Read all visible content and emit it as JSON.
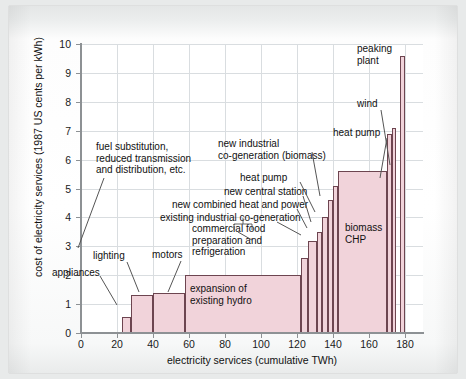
{
  "chart_data": {
    "type": "bar",
    "title": "",
    "xlabel": "electricity services (cumulative TWh)",
    "ylabel": "cost of electricity services (1987 US cents per kWh)",
    "xlim": [
      0,
      190
    ],
    "ylim": [
      0,
      10
    ],
    "xticks": [
      0,
      20,
      40,
      60,
      80,
      100,
      120,
      140,
      160,
      180
    ],
    "yticks": [
      0,
      1,
      2,
      3,
      4,
      5,
      6,
      7,
      8,
      9,
      10
    ],
    "grid": true,
    "legend": "none",
    "note": "supply curve: each bar spans a cumulative TWh range (x_start to x_end) at a cost in 1987 US cents per kWh",
    "bars": [
      {
        "label": "appliances",
        "x_start": 23,
        "x_end": 28,
        "value": 0.55
      },
      {
        "label": "lighting",
        "x_start": 28,
        "x_end": 40,
        "value": 1.3
      },
      {
        "label": "motors",
        "x_start": 40,
        "x_end": 58,
        "value": 1.4
      },
      {
        "label": "expansion of existing hydro",
        "x_start": 58,
        "x_end": 122,
        "value": 2.0
      },
      {
        "label": "commercial food preparation and refrigeration",
        "x_start": 122,
        "x_end": 126,
        "value": 2.6
      },
      {
        "label": "existing industrial co-generation",
        "x_start": 126,
        "x_end": 131,
        "value": 3.2
      },
      {
        "label": "new combined heat and power",
        "x_start": 131,
        "x_end": 134,
        "value": 3.5
      },
      {
        "label": "new central station",
        "x_start": 134,
        "x_end": 137,
        "value": 4.0
      },
      {
        "label": "heat pump",
        "x_start": 137,
        "x_end": 140,
        "value": 4.6
      },
      {
        "label": "new industrial co-generation (biomass)",
        "x_start": 140,
        "x_end": 143,
        "value": 5.1
      },
      {
        "label": "biomass CHP",
        "x_start": 143,
        "x_end": 170,
        "value": 5.6
      },
      {
        "label": "heat pump",
        "x_start": 170,
        "x_end": 173,
        "value": 6.9
      },
      {
        "label": "wind",
        "x_start": 173,
        "x_end": 175,
        "value": 7.1
      },
      {
        "label": "peaking plant",
        "x_start": 177,
        "x_end": 180,
        "value": 9.6
      }
    ],
    "annotations": [
      {
        "name": "fuel-substitution",
        "text": "fuel substitution,\nreduced transmission\nand distribution, etc."
      },
      {
        "name": "appliances",
        "text": "appliances"
      },
      {
        "name": "lighting",
        "text": "lighting"
      },
      {
        "name": "motors",
        "text": "motors"
      },
      {
        "name": "commercial-food",
        "text": "commercial food\npreparation and\nrefrigeration"
      },
      {
        "name": "existing-industrial-cogen",
        "text": "existing industrial co-generation"
      },
      {
        "name": "new-chp",
        "text": "new combined heat and power"
      },
      {
        "name": "new-central-station",
        "text": "new central station"
      },
      {
        "name": "heat-pump-1",
        "text": "heat pump"
      },
      {
        "name": "new-industrial-cogen",
        "text": "new industrial\nco-generation (biomass)"
      },
      {
        "name": "heat-pump-2",
        "text": "heat pump"
      },
      {
        "name": "wind",
        "text": "wind"
      },
      {
        "name": "peaking-plant",
        "text": "peaking\nplant"
      },
      {
        "name": "expansion-hydro",
        "text": "expansion of\nexisting hydro"
      },
      {
        "name": "biomass-chp",
        "text": "biomass\nCHP"
      }
    ]
  },
  "colors": {
    "bar_fill": "#f1d3da",
    "bar_stroke": "#6d4550",
    "grid": "#d9dde0",
    "axis": "#8d9194",
    "text": "#111111",
    "page_bg": "#e8eaea"
  }
}
